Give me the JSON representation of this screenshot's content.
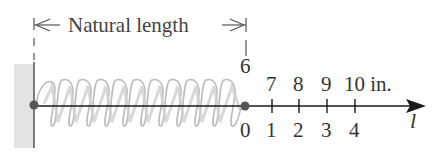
{
  "diagram": {
    "title_label": "Natural length",
    "top_scale": {
      "natural_mark": "6",
      "labels": [
        "7",
        "8",
        "9",
        "10 in."
      ]
    },
    "bottom_scale": {
      "labels": [
        "0",
        "1",
        "2",
        "3",
        "4"
      ]
    },
    "axis_variable": "l",
    "colors": {
      "spring": "#b8b8b8",
      "axis": "#1a1a1a",
      "wall": "#e2e2e2",
      "text": "#333333",
      "dot": "#555555"
    }
  }
}
